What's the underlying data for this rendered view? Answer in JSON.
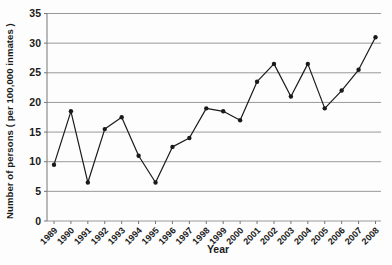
{
  "chart_data": {
    "type": "line",
    "title": "",
    "xlabel": "Year",
    "ylabel": "Number of persons ( per 100,000 inmates )",
    "x": [
      "1989",
      "1990",
      "1991",
      "1992",
      "1993",
      "1994",
      "1995",
      "1996",
      "1997",
      "1998",
      "1999",
      "2000",
      "2001",
      "2002",
      "2003",
      "2004",
      "2005",
      "2006",
      "2007",
      "2008"
    ],
    "series": [
      {
        "name": "Number of persons per 100,000 inmates",
        "values": [
          9.5,
          18.5,
          6.5,
          15.5,
          17.5,
          11,
          6.5,
          12.5,
          14,
          19,
          18.5,
          17,
          23.5,
          26.5,
          21,
          26.5,
          19,
          22,
          25.5,
          31
        ]
      }
    ],
    "ylim": [
      0,
      35
    ],
    "yticks": [
      0,
      5,
      10,
      15,
      20,
      25,
      30,
      35
    ],
    "grid": "horizontal gridlines at every y tick",
    "legend": "none",
    "marker": "small filled dot",
    "x_tick_label_rotation_deg": -45,
    "colors": {
      "line": "#1a1a1a",
      "grid": "#999999",
      "axis": "#777777",
      "text": "#1a1a1a",
      "background": "#fdfdfd"
    }
  }
}
